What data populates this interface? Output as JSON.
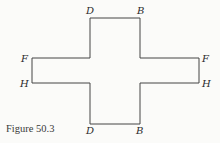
{
  "figure": {
    "caption": "Figure 50.3",
    "shape": "cross-polygon",
    "stroke_color": "#444444",
    "background": "#fbfbf9",
    "vertices": [
      [
        90,
        18
      ],
      [
        140,
        18
      ],
      [
        140,
        58
      ],
      [
        199,
        58
      ],
      [
        199,
        83
      ],
      [
        140,
        83
      ],
      [
        140,
        124
      ],
      [
        90,
        124
      ],
      [
        90,
        83
      ],
      [
        32,
        83
      ],
      [
        32,
        58
      ],
      [
        90,
        58
      ]
    ],
    "labels": {
      "top_left": "D",
      "top_right": "B",
      "left_upper": "F",
      "left_lower": "H",
      "right_upper": "F",
      "right_lower": "H",
      "bottom_left": "D",
      "bottom_right": "B"
    }
  }
}
